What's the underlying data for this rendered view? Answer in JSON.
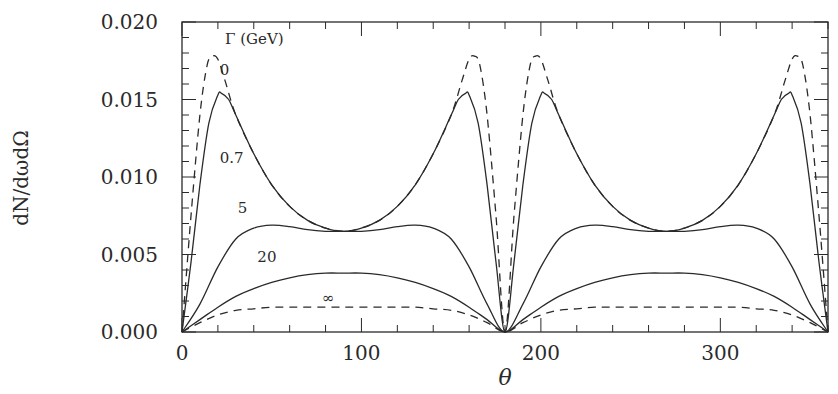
{
  "chart_data": {
    "type": "line",
    "title": "",
    "xlabel": "θ",
    "ylabel": "dN/dωdΩ",
    "xlim": [
      0,
      360
    ],
    "ylim": [
      0,
      0.02
    ],
    "xticks": [
      0,
      100,
      200,
      300
    ],
    "yticks": [
      0.0,
      0.005,
      0.01,
      0.015,
      0.02
    ],
    "ytick_labels": [
      "0.000",
      "0.005",
      "0.010",
      "0.015",
      "0.020"
    ],
    "xtick_labels": [
      "0",
      "100",
      "200",
      "300"
    ],
    "grid": false,
    "legend_title": "Γ (GeV)",
    "series": [
      {
        "name": "0",
        "style": "dashed",
        "x": [
          0,
          5,
          10,
          14,
          17,
          20,
          24,
          30,
          40,
          50,
          60,
          70,
          80,
          90,
          100,
          110,
          120,
          130,
          140,
          150,
          156,
          160,
          163,
          166,
          170,
          175,
          180
        ],
        "y": [
          0,
          0.0075,
          0.014,
          0.0172,
          0.0178,
          0.0176,
          0.0162,
          0.014,
          0.0115,
          0.0095,
          0.0081,
          0.0072,
          0.0067,
          0.0065,
          0.0067,
          0.0072,
          0.0081,
          0.0095,
          0.0115,
          0.014,
          0.0162,
          0.0176,
          0.0178,
          0.0172,
          0.014,
          0.0075,
          0
        ]
      },
      {
        "name": "0.7",
        "style": "solid",
        "x": [
          0,
          5,
          10,
          15,
          20,
          22,
          26,
          30,
          40,
          50,
          60,
          70,
          80,
          90,
          100,
          110,
          120,
          130,
          140,
          150,
          154,
          158,
          160,
          165,
          170,
          175,
          180
        ],
        "y": [
          0,
          0.0045,
          0.0095,
          0.0135,
          0.0153,
          0.0154,
          0.015,
          0.014,
          0.0115,
          0.0095,
          0.0081,
          0.0072,
          0.0067,
          0.0065,
          0.0067,
          0.0072,
          0.0081,
          0.0095,
          0.0115,
          0.014,
          0.015,
          0.0154,
          0.0153,
          0.0135,
          0.0095,
          0.0045,
          0
        ]
      },
      {
        "name": "5",
        "style": "solid",
        "x": [
          0,
          10,
          20,
          30,
          40,
          50,
          60,
          70,
          80,
          90,
          100,
          110,
          120,
          130,
          140,
          150,
          160,
          170,
          180
        ],
        "y": [
          0,
          0.0018,
          0.0042,
          0.006,
          0.0067,
          0.0069,
          0.0068,
          0.0066,
          0.0065,
          0.0065,
          0.0065,
          0.0066,
          0.0068,
          0.0069,
          0.0067,
          0.006,
          0.0042,
          0.0018,
          0
        ]
      },
      {
        "name": "20",
        "style": "solid",
        "x": [
          0,
          10,
          20,
          30,
          40,
          50,
          60,
          70,
          80,
          90,
          100,
          110,
          120,
          130,
          140,
          150,
          160,
          170,
          180
        ],
        "y": [
          0,
          0.0008,
          0.0016,
          0.0023,
          0.0028,
          0.0032,
          0.0035,
          0.0037,
          0.0038,
          0.0038,
          0.0038,
          0.0037,
          0.0035,
          0.0032,
          0.0028,
          0.0023,
          0.0016,
          0.0008,
          0
        ]
      },
      {
        "name": "∞",
        "style": "dashed",
        "x": [
          0,
          10,
          20,
          30,
          40,
          50,
          60,
          90,
          120,
          130,
          140,
          150,
          160,
          170,
          180
        ],
        "y": [
          0,
          0.0006,
          0.0011,
          0.0014,
          0.0015,
          0.0016,
          0.0016,
          0.0016,
          0.0016,
          0.0016,
          0.0015,
          0.0014,
          0.0011,
          0.0006,
          0
        ]
      }
    ],
    "annotations": [
      {
        "text": "Γ (GeV)",
        "x": 24,
        "y": 0.0186
      },
      {
        "text": "0",
        "x": 21,
        "y": 0.0166
      },
      {
        "text": "0.7",
        "x": 21,
        "y": 0.0109
      },
      {
        "text": "5",
        "x": 31,
        "y": 0.0077
      },
      {
        "text": "20",
        "x": 42,
        "y": 0.0045
      },
      {
        "text": "∞",
        "x": 78,
        "y": 0.0019
      }
    ],
    "symmetry_note": "curves repeat with period 180 (mirror about θ=180)"
  }
}
